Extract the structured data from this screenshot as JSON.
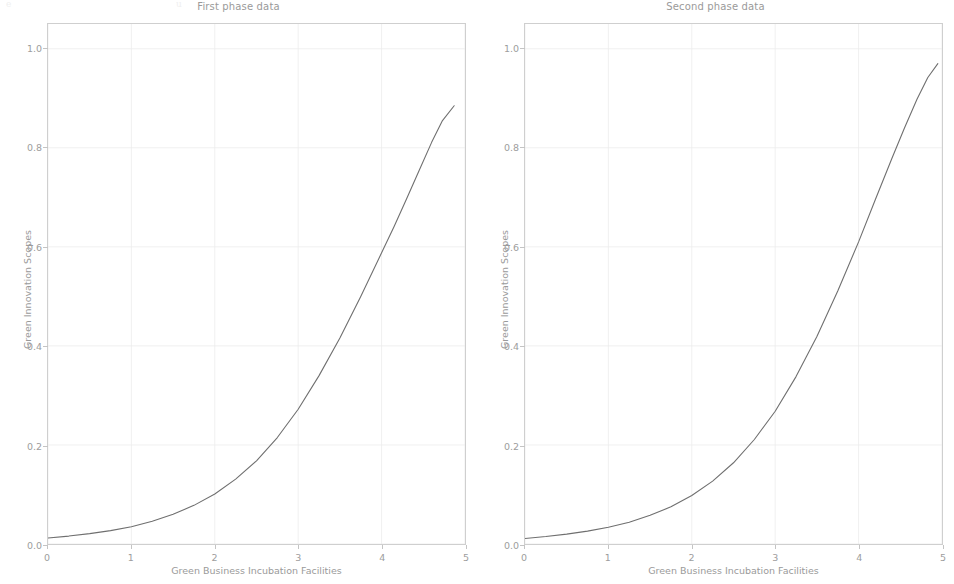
{
  "figure": {
    "width": 954,
    "height": 584,
    "background": "#ffffff",
    "bleed_top_left": "e",
    "bleed_top_mid": "u"
  },
  "style": {
    "line_color": "#6f6f6f",
    "grid_color": "#ececec",
    "spine_color": "#cfcfcf",
    "text_color": "#9a9a9a",
    "tick_color": "#9d9d9d"
  },
  "chart_data": [
    {
      "type": "line",
      "title": "First phase data",
      "xlabel": "Green Business Incubation Facilities",
      "ylabel": "Green Innovation Scopes",
      "xlim": [
        0,
        5
      ],
      "ylim": [
        0,
        1.05
      ],
      "grid": true,
      "legend": "none",
      "xticks": [
        "0",
        "1",
        "2",
        "3",
        "4",
        "5"
      ],
      "xtick_values": [
        0,
        1,
        2,
        3,
        4,
        5
      ],
      "yticks": [
        "0.0",
        "0.2",
        "0.4",
        "0.6",
        "0.8",
        "1.0"
      ],
      "ytick_values": [
        0.0,
        0.2,
        0.4,
        0.6,
        0.8,
        1.0
      ],
      "series": [
        {
          "name": "first phase",
          "color": "#6f6f6f",
          "x": [
            0.0,
            0.25,
            0.5,
            0.75,
            1.0,
            1.25,
            1.5,
            1.75,
            2.0,
            2.25,
            2.5,
            2.75,
            3.0,
            3.25,
            3.5,
            3.75,
            4.0,
            4.15,
            4.3,
            4.45,
            4.6,
            4.73,
            4.87
          ],
          "y": [
            0.012,
            0.016,
            0.021,
            0.027,
            0.035,
            0.046,
            0.06,
            0.078,
            0.101,
            0.131,
            0.168,
            0.215,
            0.272,
            0.34,
            0.416,
            0.5,
            0.588,
            0.641,
            0.697,
            0.754,
            0.811,
            0.855,
            0.885
          ]
        }
      ]
    },
    {
      "type": "line",
      "title": "Second phase data",
      "xlabel": "Green Business Incubation Facilities",
      "ylabel": "Green Innovation Scopes",
      "xlim": [
        0,
        5
      ],
      "ylim": [
        0,
        1.05
      ],
      "grid": true,
      "legend": "none",
      "xticks": [
        "0",
        "1",
        "2",
        "3",
        "4",
        "5"
      ],
      "xtick_values": [
        0,
        1,
        2,
        3,
        4,
        5
      ],
      "yticks": [
        "0.0",
        "0.2",
        "0.4",
        "0.6",
        "0.8",
        "1.0"
      ],
      "ytick_values": [
        0.0,
        0.2,
        0.4,
        0.6,
        0.8,
        1.0
      ],
      "series": [
        {
          "name": "second phase",
          "color": "#6f6f6f",
          "x": [
            0.0,
            0.25,
            0.5,
            0.75,
            1.0,
            1.25,
            1.5,
            1.75,
            2.0,
            2.25,
            2.5,
            2.75,
            3.0,
            3.25,
            3.5,
            3.75,
            4.0,
            4.2,
            4.4,
            4.55,
            4.7,
            4.83,
            4.95
          ],
          "y": [
            0.011,
            0.015,
            0.02,
            0.026,
            0.034,
            0.044,
            0.058,
            0.075,
            0.098,
            0.127,
            0.164,
            0.211,
            0.268,
            0.338,
            0.419,
            0.511,
            0.61,
            0.695,
            0.779,
            0.84,
            0.898,
            0.942,
            0.97
          ]
        }
      ]
    }
  ]
}
